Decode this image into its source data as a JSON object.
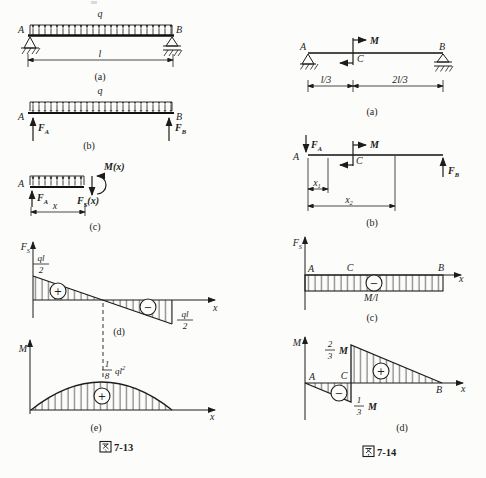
{
  "figure13": {
    "caption": {
      "cjk": "图",
      "num": "7-13"
    },
    "part_a": {
      "load": "q",
      "left_support": "A",
      "right_support": "B",
      "span": "l",
      "tag": "(a)"
    },
    "part_b": {
      "load": "q",
      "left_end": "A",
      "right_end": "B",
      "reaction_left": {
        "base": "F",
        "sub": "A"
      },
      "reaction_right": {
        "base": "F",
        "sub": "B"
      },
      "tag": "(b)"
    },
    "part_c": {
      "left_end": "A",
      "reaction_left": {
        "base": "F",
        "sub": "A"
      },
      "shear": {
        "base": "F",
        "sub": "S",
        "arg": "(x)"
      },
      "moment": {
        "base": "M",
        "arg": "(x)"
      },
      "dim": "x",
      "tag": "(c)"
    },
    "part_d": {
      "axis_y": {
        "base": "F",
        "sub": "S"
      },
      "axis_x": "x",
      "top_value": {
        "num": "ql",
        "den": "2"
      },
      "bottom_value": {
        "num": "ql",
        "den": "2"
      },
      "plus": "+",
      "minus": "−",
      "tag": "(d)"
    },
    "part_e": {
      "axis_y": "M",
      "axis_x": "x",
      "peak_value": {
        "num": "1",
        "den": "8",
        "expr": "ql",
        "sup": "2"
      },
      "plus": "+",
      "tag": "(e)"
    }
  },
  "figure14": {
    "caption": {
      "cjk": "图",
      "num": "7-14"
    },
    "part_a": {
      "left_support": "A",
      "right_support": "B",
      "couple_point": "C",
      "couple": "M",
      "dim_left": "l/3",
      "dim_right": "2l/3",
      "tag": "(a)"
    },
    "part_b": {
      "left_end": "A",
      "couple_point": "C",
      "couple": "M",
      "reaction_left": {
        "base": "F",
        "sub": "A"
      },
      "reaction_right": {
        "base": "F",
        "sub": "B"
      },
      "dim1": {
        "base": "x",
        "sub": "1"
      },
      "dim2": {
        "base": "x",
        "sub": "2"
      },
      "tag": "(b)"
    },
    "part_c": {
      "axis_y": {
        "base": "F",
        "sub": "S"
      },
      "axis_x": "x",
      "pt_a": "A",
      "pt_c": "C",
      "pt_b": "B",
      "value": "M/l",
      "minus": "−",
      "tag": "(c)"
    },
    "part_d": {
      "axis_y": "M",
      "axis_x": "x",
      "pt_a": "A",
      "pt_c": "C",
      "pt_b": "B",
      "top_value": {
        "num": "2",
        "den": "3",
        "sym": "M"
      },
      "bottom_value": {
        "num": "1",
        "den": "3",
        "sym": "M"
      },
      "plus": "+",
      "minus": "−",
      "tag": "(d)"
    }
  }
}
